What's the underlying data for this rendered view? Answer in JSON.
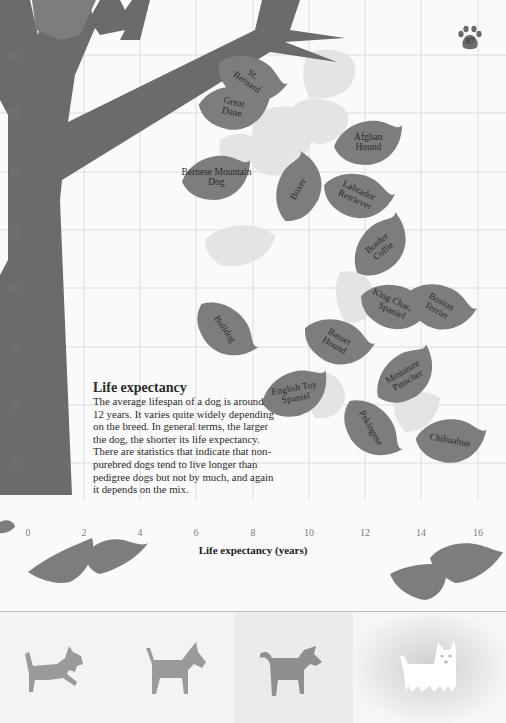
{
  "page_number": "87",
  "text": {
    "heading": "Life expectancy",
    "body": "The average lifespan of a dog is around 12 years. It varies quite widely depending on the breed. In general terms, the larger the dog, the shorter its life expectancy. There are statistics that indicate that non-purebred dogs tend to live longer than pedigree dogs but not by much, and again it depends on the mix."
  },
  "colors": {
    "leaf": "#7d7d7d",
    "leaf_ghost": "#e3e3e3",
    "tree": "#6b6b6b",
    "grid": "#dcdcdc",
    "background": "#fafafa"
  },
  "chart_data": {
    "type": "scatter",
    "title": "Life expectancy",
    "xlabel": "Life expectancy (years)",
    "ylabel": "",
    "xlim": [
      0,
      16
    ],
    "ylim": [
      0,
      85
    ],
    "x_ticks": [
      "0",
      "2",
      "4",
      "6",
      "8",
      "10",
      "12",
      "14",
      "16"
    ],
    "y_ticks": [
      "10",
      "20",
      "30",
      "40",
      "50",
      "60",
      "70",
      "80"
    ],
    "grid": true,
    "legend": "none",
    "points": [
      {
        "label": "St. Bernard",
        "x": 7.9,
        "y": 76,
        "rot": 35
      },
      {
        "label": "Great Dane",
        "x": 7.3,
        "y": 71,
        "rot": 12
      },
      {
        "label": "Bernese Mountain Dog",
        "x": 6.7,
        "y": 59,
        "rot": 0
      },
      {
        "label": "Boxer",
        "x": 9.6,
        "y": 57,
        "rot": -60
      },
      {
        "label": "Afghan Hound",
        "x": 12.1,
        "y": 65,
        "rot": 0
      },
      {
        "label": "Labrador Retriever",
        "x": 11.7,
        "y": 56,
        "rot": 25
      },
      {
        "label": "Border Collie",
        "x": 12.5,
        "y": 47,
        "rot": -40
      },
      {
        "label": "King Charles Spaniel",
        "x": 13.0,
        "y": 37,
        "rot": 25
      },
      {
        "label": "Boston Terrier",
        "x": 14.6,
        "y": 37,
        "rot": 30
      },
      {
        "label": "Bulldog",
        "x": 7.0,
        "y": 33,
        "rot": 55
      },
      {
        "label": "Basset Hound",
        "x": 11.0,
        "y": 31,
        "rot": 30
      },
      {
        "label": "Miniature Pinscher",
        "x": 13.4,
        "y": 25,
        "rot": -30
      },
      {
        "label": "English Toy Spaniel",
        "x": 9.5,
        "y": 22,
        "rot": -10
      },
      {
        "label": "Pekingese",
        "x": 12.2,
        "y": 16,
        "rot": 60
      },
      {
        "label": "Chihuahua",
        "x": 15.0,
        "y": 14,
        "rot": 10
      }
    ]
  },
  "footer": {
    "icons": [
      {
        "name": "dog-playing"
      },
      {
        "name": "dog-standing"
      },
      {
        "name": "dog-walking"
      },
      {
        "name": "dog-white-highlighted"
      }
    ]
  }
}
